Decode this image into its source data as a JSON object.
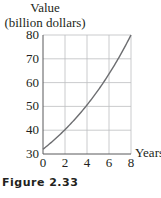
{
  "chart_data": {
    "type": "line",
    "title": "",
    "ylabel": "Value (billion dollars)",
    "ylabel_lines": [
      "Value",
      "(billion dollars)"
    ],
    "xlabel": "Years",
    "x_ticks": [
      0,
      2,
      4,
      6,
      8
    ],
    "y_ticks": [
      30,
      40,
      50,
      60,
      70,
      80
    ],
    "xlim": [
      0,
      8
    ],
    "ylim": [
      30,
      80
    ],
    "grid": true,
    "legend": null,
    "series": [
      {
        "name": "Value",
        "x": [
          0,
          1,
          2,
          3,
          4,
          5,
          6,
          7,
          8
        ],
        "y": [
          32,
          35.8,
          40.1,
          45.0,
          50.4,
          56.4,
          63.2,
          70.7,
          80
        ]
      }
    ]
  },
  "caption": "Figure 2.33",
  "colors": {
    "curve": "#6d6e71",
    "grid": "#bcbec0",
    "axis": "#58595b",
    "text": "#231f20"
  }
}
